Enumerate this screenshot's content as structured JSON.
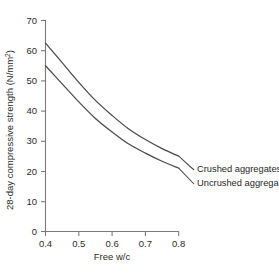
{
  "chart_data": {
    "type": "line",
    "title": "",
    "xlabel": "Free w/c",
    "ylabel": "28-day compressive strength (N/mm",
    "ylabel_super": "2",
    "ylabel_tail": ")",
    "xlim": [
      0.4,
      0.8
    ],
    "ylim": [
      0,
      70
    ],
    "grid": false,
    "legend_position": "inline-right-end-labels",
    "xticks": [
      0.4,
      0.5,
      0.6,
      0.7,
      0.8
    ],
    "xtick_labels": [
      "0.4",
      "0.5",
      "0.6",
      "0.7",
      "0.8"
    ],
    "yticks": [
      0,
      10,
      20,
      30,
      40,
      50,
      60,
      70
    ],
    "ytick_labels": [
      "0",
      "10",
      "20",
      "30",
      "40",
      "50",
      "60",
      "70"
    ],
    "series": [
      {
        "name": "Crushed aggregates",
        "color": "#4a4a4a",
        "x": [
          0.4,
          0.45,
          0.5,
          0.55,
          0.6,
          0.65,
          0.7,
          0.75,
          0.8
        ],
        "values": [
          62.5,
          56.0,
          49.5,
          43.5,
          38.5,
          34.0,
          30.5,
          27.5,
          25.0
        ]
      },
      {
        "name": "Uncrushed aggregates",
        "color": "#4a4a4a",
        "x": [
          0.4,
          0.45,
          0.5,
          0.55,
          0.6,
          0.65,
          0.7,
          0.75,
          0.8
        ],
        "values": [
          55.0,
          49.0,
          43.0,
          37.5,
          33.0,
          29.0,
          26.0,
          23.3,
          21.0
        ]
      }
    ]
  },
  "labels": {
    "crushed": "Crushed aggregates",
    "uncrushed": "Uncrushed aggregates"
  }
}
